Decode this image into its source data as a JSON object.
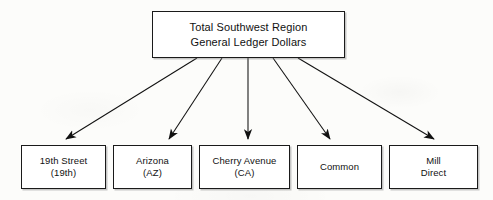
{
  "diagram": {
    "root": {
      "label": "Total Southwest Region\nGeneral Ledger Dollars",
      "line1": "Total Southwest Region",
      "line2": "General Ledger Dollars"
    },
    "children": [
      {
        "label": "19th Street\n(19th)",
        "name": "19th Street",
        "code": "(19th)"
      },
      {
        "label": "Arizona\n(AZ)",
        "name": "Arizona",
        "code": "(AZ)"
      },
      {
        "label": "Cherry Avenue\n(CA)",
        "name": "Cherry Avenue",
        "code": "(CA)"
      },
      {
        "label": "Common",
        "name": "Common",
        "code": ""
      },
      {
        "label": "Mill\nDirect",
        "name": "Mill Direct",
        "code": ""
      }
    ],
    "connectors": [
      {
        "from": "root",
        "to": "19th Street",
        "style": "solid-arrow"
      },
      {
        "from": "root",
        "to": "Arizona",
        "style": "solid-arrow"
      },
      {
        "from": "root",
        "to": "Cherry Avenue",
        "style": "solid-arrow"
      },
      {
        "from": "root",
        "to": "Common",
        "style": "solid-arrow"
      },
      {
        "from": "root",
        "to": "Mill Direct",
        "style": "solid-arrow"
      }
    ],
    "colors": {
      "background": "#fcfcfa",
      "box_fill": "#ffffff",
      "border": "#1a1a1a",
      "text": "#111111",
      "connector": "#111111",
      "shadow": "#7d7d7d"
    }
  }
}
